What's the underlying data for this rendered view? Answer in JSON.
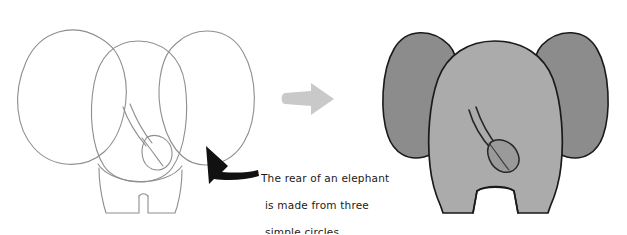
{
  "page": {
    "background_color": "#ffffff",
    "width": 627,
    "height": 234
  },
  "colors": {
    "sketch_line": "#8e8e8e",
    "body_fill": "#ababab",
    "ear_fill": "#8c8c8c",
    "outline": "#1a1a1a",
    "transition_arrow": "#c9c9c9",
    "pointer_arrow": "#111111",
    "caption_text": "#1a1a1a"
  },
  "figures": {
    "left": {
      "label": "construction-sketch",
      "description": "Light pencil construction sketch of an elephant rear built from three overlapping circles",
      "parts": [
        {
          "name": "left-ear-circle",
          "label": "Left ear circle"
        },
        {
          "name": "right-ear-circle",
          "label": "Right ear circle"
        },
        {
          "name": "body-circle",
          "label": "Body circle"
        },
        {
          "name": "tail",
          "label": "Tail"
        },
        {
          "name": "legs",
          "label": "Legs"
        }
      ]
    },
    "right": {
      "label": "finished-elephant",
      "description": "Finished shaded elephant seen from behind with two large ears, body, tail and two legs",
      "parts": [
        {
          "name": "left-ear",
          "label": "Left ear"
        },
        {
          "name": "right-ear",
          "label": "Right ear"
        },
        {
          "name": "body",
          "label": "Body"
        },
        {
          "name": "tail",
          "label": "Tail"
        },
        {
          "name": "legs",
          "label": "Legs"
        }
      ]
    }
  },
  "transition_arrow": {
    "name": "step-arrow",
    "direction": "right",
    "label": "becomes"
  },
  "pointer_arrow": {
    "name": "callout-arrow",
    "direction": "up-left",
    "label": "points to elephant rear"
  },
  "caption": {
    "line1": "The rear of an elephant",
    "line2": "is made from three",
    "line3": "simple circles.",
    "full_text": "The rear of an elephant is made from three simple circles."
  }
}
